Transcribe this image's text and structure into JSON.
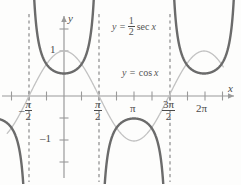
{
  "figure": {
    "title": "",
    "axes": {
      "x_axis_label": "x",
      "y_axis_label": "y",
      "x_ticks": [
        {
          "value": -1.5707963,
          "label": "-π/2",
          "label_kind": "neg-frac",
          "num": "π",
          "den": "2",
          "sign": "–"
        },
        {
          "value": 1.5707963,
          "label": "π/2",
          "label_kind": "frac",
          "num": "π",
          "den": "2",
          "sign": ""
        },
        {
          "value": 3.1415927,
          "label": "π",
          "label_kind": "plain",
          "num": "",
          "den": "",
          "sign": ""
        },
        {
          "value": 4.712389,
          "label": "3π/2",
          "label_kind": "frac",
          "num": "3π",
          "den": "2",
          "sign": ""
        },
        {
          "value": 6.2831853,
          "label": "2π",
          "label_kind": "plain",
          "num": "",
          "den": "",
          "sign": ""
        }
      ],
      "y_ticks": [
        {
          "value": 1,
          "label": "1"
        },
        {
          "value": -1,
          "label": "–1"
        }
      ],
      "xlim": [
        -2.5132741,
        7.1
      ],
      "ylim": [
        -2.0,
        1.95
      ],
      "grid": false
    },
    "annotations": [
      {
        "name": "sec-equation",
        "text": "y = ½ sec x",
        "lhs": "y =",
        "num": "1",
        "den": "2",
        "fn": "sec",
        "var": "x",
        "x_px": 112,
        "y_px": 17
      },
      {
        "name": "cos-equation",
        "text": "y = cos x",
        "lhs": "y =",
        "fn": "cos",
        "var": "x",
        "x_px": 122,
        "y_px": 67
      }
    ],
    "asymptotes": {
      "label": "vertical asymptotes",
      "values": [
        -1.5707963,
        1.5707963,
        4.712389
      ],
      "style": "dashed"
    },
    "colors": {
      "secant_curve": "#6b6b6b",
      "cosine_curve": "#c2c2c2",
      "axis": "#9a9a9a",
      "asymptote": "#8a8a8a",
      "text": "#4a4a4a",
      "background": "#fdfdfc"
    }
  },
  "chart_data": {
    "type": "line",
    "title": "",
    "xlabel": "x",
    "ylabel": "y",
    "xlim": [
      -2.51,
      7.1
    ],
    "ylim": [
      -2.0,
      1.95
    ],
    "grid": false,
    "legend_position": "inside-annotations",
    "x_tick_values": [
      -1.5707963,
      1.5707963,
      3.1415927,
      4.712389,
      6.2831853
    ],
    "x_tick_labels": [
      "-π/2",
      "π/2",
      "π",
      "3π/2",
      "2π"
    ],
    "y_tick_values": [
      1,
      -1
    ],
    "y_tick_labels": [
      "1",
      "–1"
    ],
    "vertical_asymptotes": [
      -1.5707963,
      1.5707963,
      4.712389
    ],
    "series": [
      {
        "name": "y = 1/2 sec x",
        "expression": "0.5*sec(x)",
        "color": "#6b6b6b",
        "width": 2.4,
        "key_points": [
          {
            "x": 0,
            "y": 0.5
          },
          {
            "x": 3.1415927,
            "y": -0.5
          },
          {
            "x": 6.2831853,
            "y": 0.5
          }
        ]
      },
      {
        "name": "y = cos x",
        "expression": "cos(x)",
        "color": "#c2c2c2",
        "width": 1.3,
        "key_points": [
          {
            "x": -1.5707963,
            "y": 0
          },
          {
            "x": 0,
            "y": 1
          },
          {
            "x": 1.5707963,
            "y": 0
          },
          {
            "x": 3.1415927,
            "y": -1
          },
          {
            "x": 4.712389,
            "y": 0
          },
          {
            "x": 6.2831853,
            "y": 1
          }
        ]
      }
    ],
    "annotations": [
      {
        "text": "y = 1/2 sec x",
        "x": 2.3,
        "y": 1.75
      },
      {
        "text": "y = cos x",
        "x": 2.6,
        "y": 0.65
      }
    ]
  }
}
